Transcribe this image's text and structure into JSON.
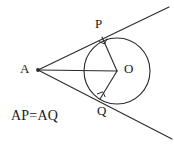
{
  "figure": {
    "background_color": "#ffffff",
    "stroke_color": "#2b2b2b",
    "text_color": "#1a1a1a",
    "width": 174,
    "height": 146,
    "labels": {
      "external_point": "A",
      "tangent_point_upper": "P",
      "center": "O",
      "tangent_point_lower": "Q"
    },
    "annotation": {
      "equation": "AP=AQ"
    },
    "markers": {
      "right_angle_at_P": "right-angle",
      "right_angle_at_Q": "right-angle"
    }
  },
  "geometry": {
    "circle": {
      "cx": 117,
      "cy": 71,
      "r": 33
    },
    "points": {
      "A": {
        "x": 38,
        "y": 70
      },
      "P": {
        "x": 102,
        "y": 37
      },
      "O": {
        "x": 117,
        "y": 71
      },
      "Q": {
        "x": 100,
        "y": 99
      }
    },
    "segments": [
      {
        "name": "AO",
        "from": "A",
        "to": "O"
      },
      {
        "name": "OP",
        "from": "O",
        "to": "P"
      },
      {
        "name": "OQ",
        "from": "O",
        "to": "Q"
      }
    ],
    "tangent_upper": {
      "x1": 38,
      "y1": 70,
      "x2": 169,
      "y2": 7
    },
    "tangent_lower": {
      "x1": 38,
      "y1": 70,
      "x2": 172,
      "y2": 139
    }
  }
}
